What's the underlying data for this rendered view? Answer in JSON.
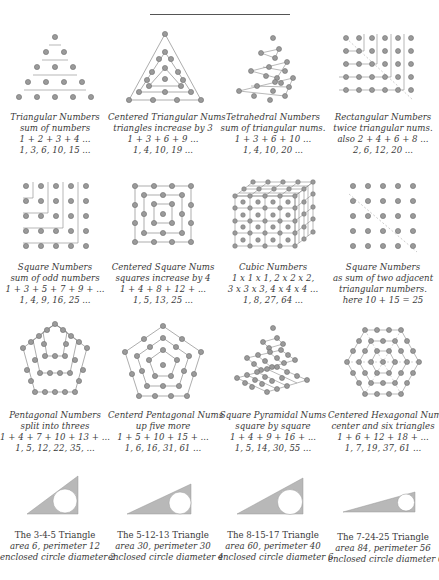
{
  "colors": {
    "dot_fill": "#9a9a9a",
    "dot_stroke": "#6e6e6e",
    "line": "#8a8a8a",
    "triangle_fill": "#b8b8b8",
    "text": "#3a3a3a"
  },
  "rows": [
    [
      {
        "title": "Triangular Numbers",
        "lines": [
          "sum of numbers",
          "1 + 2 + 3 + 4 ...",
          "1, 3, 6, 10, 15 ..."
        ]
      },
      {
        "title": "Centered Triangular Nums",
        "lines": [
          "triangles increase by 3",
          "1 + 3 + 6 + 9 ...",
          "1, 4, 10, 19 ..."
        ]
      },
      {
        "title": "Tetrahedral Numbers",
        "lines": [
          "sum of triangular nums.",
          "1 + 3 + 6 + 10 ...",
          "1, 4, 10, 20 ..."
        ]
      },
      {
        "title": "Rectangular Numbers",
        "lines": [
          "twice triangular nums.",
          "also  2 + 4 + 6 + 8 ...",
          "2, 6, 12, 20 ..."
        ]
      }
    ],
    [
      {
        "title": "Square Numbers",
        "lines": [
          "sum of odd numbers",
          "1 + 3 + 5 + 7 + 9 + ...",
          "1, 4, 9, 16, 25 ..."
        ]
      },
      {
        "title": "Centered Square Nums",
        "lines": [
          "squares increase by 4",
          "1 + 4 + 8 + 12 + ...",
          "1, 5, 13, 25 ..."
        ]
      },
      {
        "title": "Cubic Numbers",
        "lines": [
          "1 x 1 x 1,  2 x 2 x 2,",
          "3 x 3 x 3,  4 x 4 x 4 ...",
          "1, 8, 27, 64 ..."
        ]
      },
      {
        "title": "Square Numbers",
        "lines": [
          "as sum of two adjacent",
          "triangular numbers.",
          "here  10 + 15 = 25"
        ]
      }
    ],
    [
      {
        "title": "Pentagonal Numbers",
        "lines": [
          "split into threes",
          "1 + 4 + 7 + 10 + 13 + ...",
          "1, 5, 12, 22, 35, ..."
        ]
      },
      {
        "title": "Centerd Pentagonal Nums",
        "lines": [
          "up five more",
          "1 + 5 + 10 + 15 + ...",
          "1, 6, 16, 31, 61 ..."
        ]
      },
      {
        "title": "Square Pyramidal Nums",
        "lines": [
          "square by square",
          "1 + 4 + 9 + 16 + ...",
          "1, 5, 14, 30, 55 ..."
        ]
      },
      {
        "title": "Centered Hexagonal Nums",
        "lines": [
          "center and six triangles",
          "1 + 6 + 12 + 18 + ...",
          "1, 7, 19, 37, 61 ..."
        ]
      }
    ],
    [
      {
        "title": "The 3-4-5 Triangle",
        "lines": [
          "area 6, perimeter 12",
          "enclosed circle diameter 2"
        ]
      },
      {
        "title": "The 5-12-13 Triangle",
        "lines": [
          "area 30, perimeter 30",
          "enclosed circle diameter 4"
        ]
      },
      {
        "title": "The 8-15-17 Triangle",
        "lines": [
          "area 60, perimeter 40",
          "enclosed circle diameter 6"
        ]
      },
      {
        "title": "The 7-24-25 Triangle",
        "lines": [
          "area 84, perimeter 56",
          "enclosed circle diameter 6"
        ]
      }
    ]
  ]
}
